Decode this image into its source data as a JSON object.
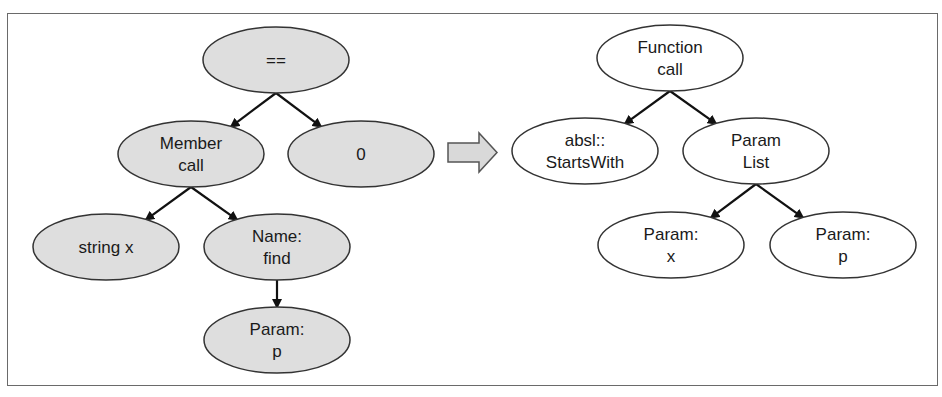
{
  "diagram": {
    "colors": {
      "before_fill": "#dedede",
      "after_fill": "#ffffff",
      "stroke": "#333333",
      "arrow_fill": "#d9d9d9"
    },
    "before_tree": {
      "nodes": [
        {
          "id": "eq",
          "lines": [
            "=="
          ],
          "cx": 276,
          "cy": 60
        },
        {
          "id": "member_call",
          "lines": [
            "Member",
            "call"
          ],
          "cx": 191,
          "cy": 154
        },
        {
          "id": "zero",
          "lines": [
            "0"
          ],
          "cx": 361,
          "cy": 154
        },
        {
          "id": "string_x",
          "lines": [
            "string x"
          ],
          "cx": 106,
          "cy": 247
        },
        {
          "id": "name_find",
          "lines": [
            "Name:",
            "find"
          ],
          "cx": 277,
          "cy": 247
        },
        {
          "id": "param_p",
          "lines": [
            "Param:",
            "p"
          ],
          "cx": 277,
          "cy": 340
        }
      ],
      "edges": [
        [
          "eq",
          "member_call"
        ],
        [
          "eq",
          "zero"
        ],
        [
          "member_call",
          "string_x"
        ],
        [
          "member_call",
          "name_find"
        ],
        [
          "name_find",
          "param_p"
        ]
      ]
    },
    "transform_arrow": "right-arrow",
    "after_tree": {
      "nodes": [
        {
          "id": "function_call",
          "lines": [
            "Function",
            "call"
          ],
          "cx": 670,
          "cy": 58
        },
        {
          "id": "absl_startswith",
          "lines": [
            "absl::",
            "StartsWith"
          ],
          "cx": 585,
          "cy": 151
        },
        {
          "id": "param_list",
          "lines": [
            "Param",
            "List"
          ],
          "cx": 756,
          "cy": 151
        },
        {
          "id": "param_x",
          "lines": [
            "Param:",
            "x"
          ],
          "cx": 671,
          "cy": 245
        },
        {
          "id": "param_p2",
          "lines": [
            "Param:",
            "p"
          ],
          "cx": 843,
          "cy": 245
        }
      ],
      "edges": [
        [
          "function_call",
          "absl_startswith"
        ],
        [
          "function_call",
          "param_list"
        ],
        [
          "param_list",
          "param_x"
        ],
        [
          "param_list",
          "param_p2"
        ]
      ]
    }
  }
}
